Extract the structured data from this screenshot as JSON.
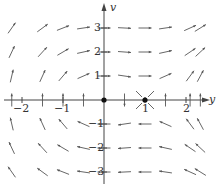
{
  "figure": {
    "type": "phase-plane-direction-field",
    "x_axis_label": "y",
    "y_axis_label": "v",
    "x_ticks": [
      {
        "value": -2,
        "label": "−2"
      },
      {
        "value": -1,
        "label": "−1"
      },
      {
        "value": 1,
        "label": "1"
      },
      {
        "value": 2,
        "label": "2"
      }
    ],
    "y_ticks": [
      {
        "value": 3,
        "label": "3"
      },
      {
        "value": 2,
        "label": "2"
      },
      {
        "value": 1,
        "label": "1"
      },
      {
        "value": -1,
        "label": "−1"
      },
      {
        "value": -2,
        "label": "−2"
      },
      {
        "value": -3,
        "label": "−3"
      }
    ],
    "equilibria": [
      {
        "y": 0,
        "v": 0,
        "label": "center"
      },
      {
        "y": 1,
        "v": 0,
        "label": "saddle"
      }
    ],
    "field": {
      "dy": "v",
      "dv": "-y + y^2"
    },
    "grid": {
      "y_values": [
        -2.25,
        -1.5,
        -1.0,
        -0.5,
        0,
        0.5,
        1.0,
        1.5,
        2.1,
        2.35
      ],
      "v_values": [
        3.0,
        2.0,
        1.0,
        0,
        -1.0,
        -2.0,
        -3.0
      ]
    },
    "colors": {
      "axis": "#444444",
      "arrow": "#555555",
      "dot": "#111111",
      "text": "#333333"
    }
  }
}
